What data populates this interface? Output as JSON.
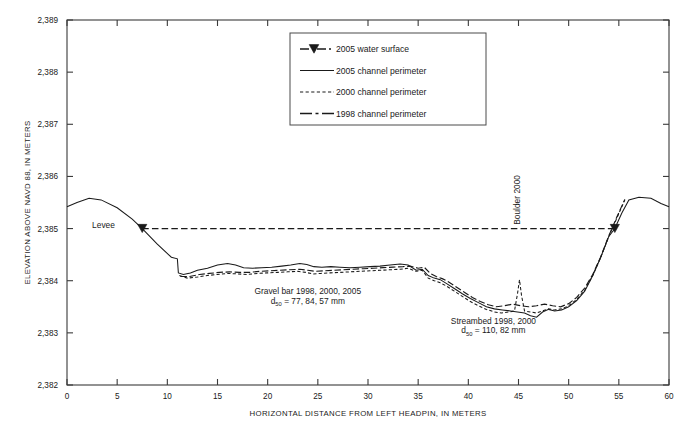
{
  "figure": {
    "background": "#ffffff",
    "ink": "#1a1a1a"
  },
  "axes": {
    "y_title": "ELEVATION ABOVE NAVD 88, IN METERS",
    "x_title": "HORIZONTAL DISTANCE FROM LEFT HEADPIN, IN METERS",
    "y_ticklabels": [
      "2,389",
      "2,388",
      "2,387",
      "2,386",
      "2,385",
      "2,384",
      "2,383",
      "2,382"
    ],
    "x_ticklabels": [
      "0",
      "5",
      "10",
      "15",
      "20",
      "25",
      "30",
      "35",
      "40",
      "45",
      "50",
      "55",
      "60"
    ]
  },
  "legend": {
    "items": [
      {
        "label": "2005 water surface",
        "style": "dashed-marker",
        "marker": "triangle-marker"
      },
      {
        "label": "2005 channel perimeter",
        "style": "solid"
      },
      {
        "label": "2000 channel perimeter",
        "style": "dotted"
      },
      {
        "label": "1998 channel perimeter",
        "style": "dash-dot"
      }
    ]
  },
  "annotations": [
    {
      "name": "levee-label",
      "text": "Levee",
      "x": 2.5,
      "y": 2385.02,
      "rotation": 0
    },
    {
      "name": "boulder-label",
      "text": "Boulder 2000",
      "x": 45.1,
      "y": 2385.55,
      "rotation": -90
    },
    {
      "name": "gravel-bar-label-line1",
      "text": "Gravel bar 1998, 2000, 2005",
      "x": 24.0,
      "y": 2383.74,
      "rotation": 0
    },
    {
      "name": "gravel-bar-label-line2",
      "text": "d",
      "sub": "50",
      "rest": " = 77, 84, 57 mm",
      "x": 24.0,
      "y": 2383.56,
      "rotation": 0
    },
    {
      "name": "streambed-label-line1",
      "text": "Streambed 1998, 2000",
      "x": 42.5,
      "y": 2383.17,
      "rotation": 0
    },
    {
      "name": "streambed-label-line2",
      "text": "d",
      "sub": "50",
      "rest": " = 110, 82 mm",
      "x": 42.5,
      "y": 2382.99,
      "rotation": 0
    }
  ],
  "chart_data": {
    "type": "line",
    "title": "",
    "xlabel": "HORIZONTAL DISTANCE FROM LEFT HEADPIN, IN METERS",
    "ylabel": "ELEVATION ABOVE NAVD 88, IN METERS",
    "xlim": [
      0,
      60
    ],
    "ylim": [
      2382,
      2389
    ],
    "xticks": [
      0,
      5,
      10,
      15,
      20,
      25,
      30,
      35,
      40,
      45,
      50,
      55,
      60
    ],
    "yticks": [
      2382,
      2383,
      2384,
      2385,
      2386,
      2387,
      2388,
      2389
    ],
    "grid": false,
    "legend_position": "top-center",
    "series": [
      {
        "name": "2005 water surface",
        "style": "dashed",
        "markers": [
          [
            7.5,
            2385.0
          ],
          [
            54.6,
            2385.0
          ]
        ],
        "x": [
          7.5,
          54.6
        ],
        "y": [
          2385.0,
          2385.0
        ]
      },
      {
        "name": "2005 channel perimeter",
        "style": "solid",
        "x": [
          0.0,
          1.0,
          2.2,
          3.4,
          5.0,
          6.5,
          7.5,
          9.0,
          10.4,
          11.0,
          11.1,
          11.6,
          12.3,
          13.0,
          14.0,
          15.0,
          16.0,
          16.8,
          17.6,
          18.5,
          19.4,
          20.4,
          21.4,
          22.3,
          23.2,
          23.9,
          24.6,
          25.4,
          26.3,
          27.2,
          28.2,
          29.2,
          30.2,
          31.2,
          32.2,
          33.2,
          34.0,
          34.8,
          35.4,
          36.0,
          36.6,
          37.2,
          37.8,
          38.6,
          39.4,
          40.2,
          41.0,
          41.8,
          42.6,
          43.4,
          44.2,
          44.9,
          45.6,
          46.2,
          46.8,
          47.4,
          48.0,
          48.6,
          49.3,
          50.0,
          50.8,
          51.6,
          52.4,
          53.2,
          54.0,
          54.6,
          55.3,
          56.0,
          57.0,
          58.2,
          59.2,
          60.0
        ],
        "y": [
          2385.42,
          2385.5,
          2385.58,
          2385.55,
          2385.4,
          2385.18,
          2385.0,
          2384.7,
          2384.45,
          2384.42,
          2384.15,
          2384.12,
          2384.15,
          2384.2,
          2384.24,
          2384.3,
          2384.33,
          2384.3,
          2384.25,
          2384.24,
          2384.25,
          2384.26,
          2384.28,
          2384.3,
          2384.33,
          2384.31,
          2384.27,
          2384.26,
          2384.27,
          2384.26,
          2384.25,
          2384.26,
          2384.27,
          2384.28,
          2384.3,
          2384.32,
          2384.3,
          2384.2,
          2384.22,
          2384.1,
          2384.05,
          2384.02,
          2383.95,
          2383.85,
          2383.75,
          2383.66,
          2383.58,
          2383.5,
          2383.46,
          2383.44,
          2383.42,
          2383.4,
          2383.38,
          2383.33,
          2383.3,
          2383.4,
          2383.45,
          2383.42,
          2383.44,
          2383.5,
          2383.62,
          2383.8,
          2384.1,
          2384.45,
          2384.85,
          2385.0,
          2385.3,
          2385.55,
          2385.6,
          2385.58,
          2385.48,
          2385.42
        ]
      },
      {
        "name": "2000 channel perimeter",
        "style": "dotted",
        "x": [
          11.2,
          12.0,
          13.0,
          14.0,
          15.0,
          16.0,
          17.0,
          18.0,
          19.0,
          20.0,
          21.0,
          22.0,
          23.0,
          23.8,
          24.5,
          25.3,
          26.2,
          27.2,
          28.2,
          29.2,
          30.2,
          31.2,
          32.2,
          33.2,
          34.0,
          34.8,
          35.4,
          36.0,
          36.6,
          37.2,
          37.8,
          38.6,
          39.4,
          40.2,
          41.0,
          41.8,
          42.6,
          43.3,
          44.0,
          44.6,
          44.9,
          45.1,
          45.3,
          45.6,
          46.2,
          46.8,
          47.4,
          48.0,
          48.6,
          49.3,
          50.0,
          50.8,
          51.6,
          52.4,
          53.2,
          54.0,
          54.8,
          55.6
        ],
        "y": [
          2384.1,
          2384.05,
          2384.07,
          2384.1,
          2384.12,
          2384.14,
          2384.13,
          2384.12,
          2384.14,
          2384.15,
          2384.16,
          2384.17,
          2384.18,
          2384.16,
          2384.13,
          2384.14,
          2384.15,
          2384.16,
          2384.17,
          2384.18,
          2384.19,
          2384.2,
          2384.21,
          2384.22,
          2384.24,
          2384.18,
          2384.2,
          2384.05,
          2384.0,
          2383.96,
          2383.9,
          2383.8,
          2383.7,
          2383.6,
          2383.52,
          2383.45,
          2383.4,
          2383.38,
          2383.4,
          2383.42,
          2383.75,
          2384.02,
          2383.72,
          2383.42,
          2383.4,
          2383.38,
          2383.42,
          2383.46,
          2383.44,
          2383.46,
          2383.52,
          2383.64,
          2383.82,
          2384.1,
          2384.45,
          2384.85,
          2385.2,
          2385.55
        ]
      },
      {
        "name": "1998 channel perimeter",
        "style": "dash-dot",
        "x": [
          11.3,
          12.2,
          13.2,
          14.2,
          15.2,
          16.2,
          17.2,
          18.2,
          19.2,
          20.2,
          21.2,
          22.2,
          23.2,
          24.0,
          24.8,
          25.6,
          26.5,
          27.5,
          28.5,
          29.5,
          30.5,
          31.5,
          32.5,
          33.5,
          34.2,
          35.0,
          35.6,
          36.2,
          36.8,
          37.4,
          38.0,
          38.8,
          39.6,
          40.4,
          41.2,
          42.0,
          42.8,
          43.6,
          44.4,
          45.2,
          46.0,
          46.8,
          47.6,
          48.4,
          49.2,
          50.0,
          50.8,
          51.6,
          52.4,
          53.2,
          54.0,
          54.8,
          55.6
        ],
        "y": [
          2384.08,
          2384.08,
          2384.12,
          2384.14,
          2384.16,
          2384.17,
          2384.16,
          2384.16,
          2384.18,
          2384.19,
          2384.2,
          2384.21,
          2384.22,
          2384.2,
          2384.18,
          2384.19,
          2384.2,
          2384.21,
          2384.22,
          2384.23,
          2384.24,
          2384.25,
          2384.26,
          2384.27,
          2384.28,
          2384.24,
          2384.26,
          2384.14,
          2384.08,
          2384.04,
          2383.98,
          2383.88,
          2383.78,
          2383.68,
          2383.6,
          2383.54,
          2383.5,
          2383.52,
          2383.55,
          2383.52,
          2383.5,
          2383.52,
          2383.55,
          2383.52,
          2383.5,
          2383.56,
          2383.68,
          2383.86,
          2384.12,
          2384.46,
          2384.86,
          2385.22,
          2385.56
        ]
      }
    ]
  }
}
